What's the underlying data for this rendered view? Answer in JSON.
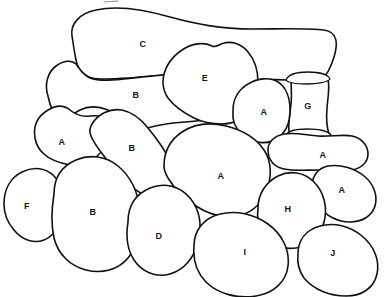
{
  "figure": {
    "background_color": "#ffffff",
    "stroke_color": "#111111",
    "label_color": "#161616",
    "width": 384,
    "height": 297,
    "label_legend": "Regions labeled A through J"
  },
  "regions": [
    {
      "id": "c-top-bone",
      "label": "C",
      "x": 143,
      "y": 44,
      "role": "elongated-top-region"
    },
    {
      "id": "e-upper-mid",
      "label": "E",
      "x": 205,
      "y": 78,
      "role": "lobed-region"
    },
    {
      "id": "b-upper",
      "label": "B",
      "x": 136,
      "y": 95,
      "role": "elongated-region"
    },
    {
      "id": "g-column",
      "label": "G",
      "x": 308,
      "y": 106,
      "role": "vertical-column-region"
    },
    {
      "id": "a-near-g",
      "label": "A",
      "x": 264,
      "y": 112,
      "role": "rounded-region"
    },
    {
      "id": "a-upper-left",
      "label": "A",
      "x": 62,
      "y": 142,
      "role": "rounded-region"
    },
    {
      "id": "b-diagonal",
      "label": "B",
      "x": 132,
      "y": 148,
      "role": "elongated-diagonal-region"
    },
    {
      "id": "a-right-upper",
      "label": "A",
      "x": 323,
      "y": 155,
      "role": "elongated-region"
    },
    {
      "id": "a-center",
      "label": "A",
      "x": 221,
      "y": 176,
      "role": "large-rounded-region"
    },
    {
      "id": "a-right-lower",
      "label": "A",
      "x": 342,
      "y": 190,
      "role": "rounded-region"
    },
    {
      "id": "f-left",
      "label": "F",
      "x": 27,
      "y": 206,
      "role": "rounded-region"
    },
    {
      "id": "h-right",
      "label": "H",
      "x": 288,
      "y": 209,
      "role": "rounded-region"
    },
    {
      "id": "b-lower-left",
      "label": "B",
      "x": 93,
      "y": 212,
      "role": "large-rounded-region"
    },
    {
      "id": "d-lower-mid",
      "label": "D",
      "x": 159,
      "y": 236,
      "role": "rounded-region"
    },
    {
      "id": "i-bottom",
      "label": "I",
      "x": 245,
      "y": 252,
      "role": "large-rounded-region"
    },
    {
      "id": "j-bottom-right",
      "label": "J",
      "x": 333,
      "y": 253,
      "role": "rounded-region"
    }
  ]
}
